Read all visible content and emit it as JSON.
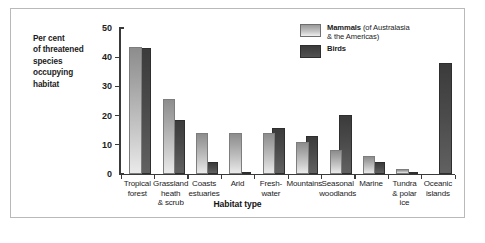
{
  "axis_caption": {
    "lines": [
      "Per cent",
      "of threatened",
      "species",
      "occupying",
      "habitat"
    ]
  },
  "legend": {
    "mammals": {
      "bold": "Mammals",
      "rest": " (of Australasia",
      "line2": "& the Americas)"
    },
    "birds": {
      "bold": "Birds",
      "rest": "",
      "line2": ""
    }
  },
  "chart_data": {
    "type": "bar",
    "title": "",
    "xlabel": "Habitat type",
    "ylabel": "Per cent of threatened species occupying habitat",
    "ylim": [
      0,
      50
    ],
    "yticks": [
      0,
      10,
      20,
      30,
      40,
      50
    ],
    "grid": false,
    "legend_position": "top-right",
    "categories": [
      "Tropical forest",
      "Grassland heath & scrub",
      "Coasts estuaries",
      "Arid",
      "Fresh-water",
      "Mountains",
      "Seasonal woodlands",
      "Marine",
      "Tundra & polar ice",
      "Oceanic islands"
    ],
    "category_lines": [
      [
        "Tropical",
        "forest"
      ],
      [
        "Grassland",
        "heath",
        "& scrub"
      ],
      [
        "Coasts",
        "estuaries"
      ],
      [
        "Arid"
      ],
      [
        "Fresh-",
        "water"
      ],
      [
        "Mountains"
      ],
      [
        "Seasonal",
        "woodlands"
      ],
      [
        "Marine"
      ],
      [
        "Tundra",
        "& polar",
        "ice"
      ],
      [
        "Oceanic",
        "islands"
      ]
    ],
    "series": [
      {
        "name": "Mammals",
        "color": "#c2c2c2",
        "values": [
          43.5,
          25.5,
          14.0,
          14.0,
          14.0,
          11.0,
          8.0,
          6.0,
          1.5,
          0
        ]
      },
      {
        "name": "Birds",
        "color": "#444444",
        "values": [
          43.0,
          18.5,
          4.0,
          0.3,
          15.5,
          13.0,
          20.0,
          4.0,
          0.5,
          38.0
        ]
      }
    ]
  }
}
